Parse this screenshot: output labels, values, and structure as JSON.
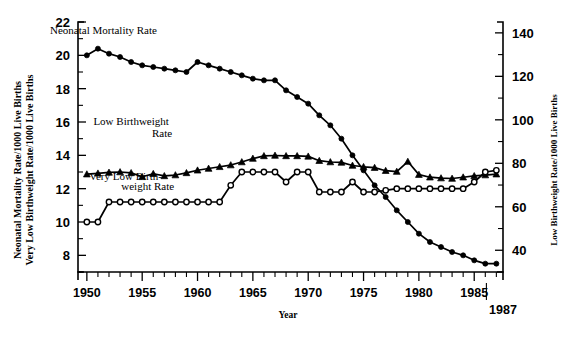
{
  "chart_data": {
    "type": "line",
    "title": "",
    "xlabel": "Year",
    "ylabel_left": "Neonatal Mortality Rate/1000 Live Births\nVery Low Birthweight Rate/1000 Live Births",
    "ylabel_left_line1": "Neonatal Mortality Rate/1000 Live Births",
    "ylabel_left_line2": "Very Low Birthweight Rate/1000 Live Births",
    "ylabel_right": "Low Birthweight Rate/1000 Live Births",
    "xlim": [
      1949.2,
      1987.6
    ],
    "ylim_left": [
      7,
      22
    ],
    "ylim_right": [
      30,
      145
    ],
    "grid": false,
    "legend": "inline-annotations",
    "x_major_ticks": [
      1950,
      1955,
      1960,
      1965,
      1970,
      1975,
      1980,
      1985
    ],
    "x_tick_labels": [
      "1950",
      "1955",
      "1960",
      "1965",
      "1970",
      "1975",
      "1980",
      "1985"
    ],
    "x_end_annotation": "1987",
    "y_left_ticks": [
      8,
      10,
      12,
      14,
      16,
      18,
      20,
      22
    ],
    "y_left_tick_labels": [
      "8",
      "10",
      "12",
      "14",
      "16",
      "18",
      "20",
      "22"
    ],
    "y_right_ticks": [
      40,
      60,
      80,
      100,
      120,
      140
    ],
    "y_right_tick_labels": [
      "40",
      "60",
      "80",
      "100",
      "120",
      "140"
    ],
    "x": [
      1950,
      1951,
      1952,
      1953,
      1954,
      1955,
      1956,
      1957,
      1958,
      1959,
      1960,
      1961,
      1962,
      1963,
      1964,
      1965,
      1966,
      1967,
      1968,
      1969,
      1970,
      1971,
      1972,
      1973,
      1974,
      1975,
      1976,
      1977,
      1978,
      1979,
      1980,
      1981,
      1982,
      1983,
      1984,
      1985,
      1986,
      1987
    ],
    "series": [
      {
        "name": "Neonatal Mortality Rate",
        "axis": "left",
        "marker": "filled-circle",
        "units": "per 1000 live births",
        "values": [
          20.0,
          20.4,
          20.1,
          19.9,
          19.6,
          19.4,
          19.3,
          19.2,
          19.1,
          19.0,
          19.6,
          19.4,
          19.2,
          19.0,
          18.8,
          18.6,
          18.5,
          18.5,
          17.9,
          17.5,
          17.1,
          16.4,
          15.8,
          15.0,
          14.0,
          13.1,
          12.2,
          11.5,
          10.7,
          10.0,
          9.3,
          8.8,
          8.5,
          8.2,
          8.0,
          7.7,
          7.5,
          7.5
        ]
      },
      {
        "name": "Low Birthweight Rate",
        "axis": "right",
        "marker": "filled-triangle",
        "units": "per 1000 live births",
        "values": [
          75.0,
          75.4,
          75.8,
          76.0,
          75.6,
          73.8,
          75.2,
          74.2,
          74.6,
          75.6,
          76.8,
          77.6,
          78.4,
          79.2,
          80.6,
          82.2,
          83.4,
          83.6,
          83.4,
          83.4,
          83.2,
          81.2,
          80.6,
          80.4,
          79.0,
          78.4,
          78.0,
          76.6,
          76.2,
          80.8,
          74.8,
          73.6,
          73.2,
          73.0,
          73.6,
          74.2,
          74.6,
          75.0
        ]
      },
      {
        "name": "Very Low Birthweight Rate",
        "axis": "left",
        "marker": "open-circle",
        "units": "per 1000 live births",
        "values": [
          10.0,
          10.0,
          11.2,
          11.2,
          11.2,
          11.2,
          11.2,
          11.2,
          11.2,
          11.2,
          11.2,
          11.2,
          11.2,
          12.2,
          13.0,
          13.0,
          13.0,
          13.0,
          12.4,
          13.0,
          13.0,
          11.8,
          11.8,
          11.8,
          12.4,
          11.8,
          11.8,
          11.9,
          12.0,
          12.0,
          12.0,
          12.0,
          12.0,
          12.0,
          12.0,
          12.4,
          13.0,
          13.1
        ]
      }
    ],
    "annotations": [
      {
        "text": "Neonatal Mortality Rate",
        "x": 1951.5,
        "y_left": 21.3
      },
      {
        "text": "Low Birthweight",
        "x": 1954.0,
        "y_left": 15.8
      },
      {
        "text": "Rate",
        "x": 1956.8,
        "y_left": 15.1
      },
      {
        "text": "Very Low Birth-",
        "x": 1953.5,
        "y_left": 12.5
      },
      {
        "text": "weight Rate",
        "x": 1955.5,
        "y_left": 11.9
      }
    ]
  },
  "labels": {
    "series1": "Neonatal Mortality Rate",
    "series2_line1": "Low Birthweight",
    "series2_line2": "Rate",
    "series3_line1": "Very Low Birth-",
    "series3_line2": "weight Rate",
    "xaxis_title": "Year",
    "end_year": "1987",
    "yleft_line1": "Neonatal Mortality Rate/1000 Live Births",
    "yleft_line2": "Very Low Birthweight Rate/1000 Live Births",
    "yright": "Low Birthweight Rate/1000 Live Births"
  },
  "colors": {
    "ink": "#000000",
    "background": "#ffffff"
  }
}
